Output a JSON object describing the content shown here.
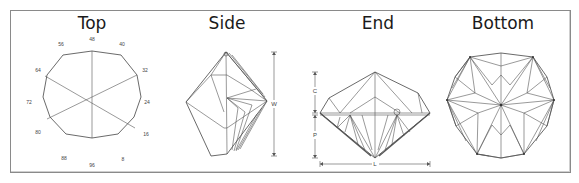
{
  "views": [
    {
      "id": "top",
      "title": "Top",
      "cx": 92
    },
    {
      "id": "side",
      "title": "Side",
      "cx": 227
    },
    {
      "id": "end",
      "title": "End",
      "cx": 375
    },
    {
      "id": "bottom",
      "title": "Bottom",
      "cx": 502
    }
  ],
  "top_view": {
    "index_labels": [
      "48",
      "40",
      "32",
      "24",
      "16",
      "8",
      "96",
      "88",
      "80",
      "72",
      "64",
      "56"
    ]
  },
  "dimensions": {
    "side_width": "W",
    "end_crown": "C",
    "end_pavilion": "P",
    "end_length": "L"
  },
  "colors": {
    "line": "#555555",
    "frame": "#8a8a8a",
    "text": "#1a1a1a"
  }
}
